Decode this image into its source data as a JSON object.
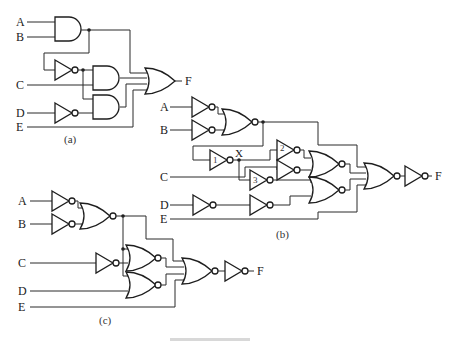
{
  "figure": {
    "type": "logic-circuit-diagrams",
    "circuits": [
      {
        "id": "a",
        "caption": "(a)",
        "inputs": [
          "A",
          "B",
          "C",
          "D",
          "E"
        ],
        "output": "F",
        "gates": [
          "AND(A,B)",
          "NOT",
          "AND",
          "NOT(D)",
          "AND",
          "OR"
        ]
      },
      {
        "id": "b",
        "caption": "(b)",
        "inputs": [
          "A",
          "B",
          "C",
          "D",
          "E"
        ],
        "output": "F",
        "node_label": "X",
        "gate_numbers": [
          "1",
          "2",
          "3"
        ],
        "gates": [
          "NOT(A)",
          "NOT(B)",
          "NOR",
          "NOT 1",
          "NOT 2",
          "NOT",
          "NOT 3",
          "NOR",
          "NOT(D)",
          "NOT",
          "NOR",
          "NOR",
          "NOT"
        ]
      },
      {
        "id": "c",
        "caption": "(c)",
        "inputs": [
          "A",
          "B",
          "C",
          "D",
          "E"
        ],
        "output": "F",
        "gates": [
          "NOT(A)",
          "NOT(B)",
          "NOR",
          "NOT(C)",
          "NOR",
          "NOR",
          "NOR",
          "NOT"
        ]
      }
    ]
  },
  "labels": {
    "a": {
      "A": "A",
      "B": "B",
      "C": "C",
      "D": "D",
      "E": "E",
      "F": "F",
      "caption": "(a)"
    },
    "b": {
      "A": "A",
      "B": "B",
      "C": "C",
      "D": "D",
      "E": "E",
      "F": "F",
      "X": "X",
      "n1": "1",
      "n2": "2",
      "n3": "3",
      "caption": "(b)"
    },
    "c": {
      "A": "A",
      "B": "B",
      "C": "C",
      "D": "D",
      "E": "E",
      "F": "F",
      "caption": "(c)"
    }
  },
  "colors": {
    "line": "#1e1e1e",
    "background": "#ffffff"
  }
}
